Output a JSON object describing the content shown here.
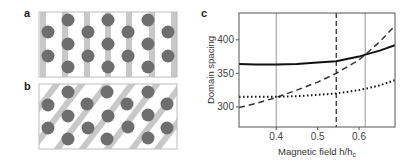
{
  "figure": {
    "panels": [
      {
        "label": "a",
        "description": "Lattice of dots with vertical stripes"
      },
      {
        "label": "b",
        "description": "Lattice of dots with tilted stripes"
      },
      {
        "label": "c",
        "description": "Domain spacing vs magnetic field"
      }
    ]
  },
  "colors": {
    "dot": "#6e6e6e",
    "stripe": "#c8c8c8",
    "frame": "#bdbdbd",
    "axis": "#555555",
    "curve": "#111111",
    "gridline": "#9a9a9a"
  },
  "panel_a": {
    "label": "a",
    "stripes_x": [
      43,
      65,
      87,
      108,
      129,
      152,
      174
    ],
    "dots": [
      [
        48,
        32
      ],
      [
        48,
        56
      ],
      [
        68,
        20
      ],
      [
        68,
        44
      ],
      [
        68,
        67
      ],
      [
        88,
        32
      ],
      [
        88,
        56
      ],
      [
        108,
        20
      ],
      [
        108,
        44
      ],
      [
        108,
        67
      ],
      [
        128,
        32
      ],
      [
        128,
        56
      ],
      [
        148,
        20
      ],
      [
        148,
        44
      ],
      [
        148,
        67
      ],
      [
        168,
        32
      ],
      [
        168,
        56
      ]
    ]
  },
  "panel_b": {
    "label": "b",
    "dots": [
      [
        48,
        105
      ],
      [
        48,
        128
      ],
      [
        68,
        92
      ],
      [
        68,
        116
      ],
      [
        68,
        139
      ],
      [
        87,
        104
      ],
      [
        88,
        128
      ],
      [
        107,
        92
      ],
      [
        108,
        116
      ],
      [
        107,
        139
      ],
      [
        127,
        104
      ],
      [
        128,
        127
      ],
      [
        148,
        92
      ],
      [
        148,
        115
      ],
      [
        148,
        138
      ],
      [
        167,
        104
      ],
      [
        167,
        128
      ]
    ]
  },
  "chart_data": {
    "type": "line",
    "panel_label": "c",
    "title": "",
    "xlabel": "Magnetic field h/h",
    "xlabel_subscript": "c",
    "ylabel": "Domain spacing",
    "xlim": [
      0.31,
      0.687
    ],
    "ylim": [
      270,
      440
    ],
    "xticks": [
      0.4,
      0.5,
      0.6
    ],
    "xtick_labels": [
      "0.4",
      "0.5",
      "0.6"
    ],
    "yticks": [
      300,
      350,
      400
    ],
    "ytick_labels": [
      "300",
      "350",
      "400"
    ],
    "grid": false,
    "legend": null,
    "vertical_lines": [
      {
        "x": 0.4,
        "style": "solid-gray"
      },
      {
        "x": 0.545,
        "style": "dashed"
      },
      {
        "x": 0.615,
        "style": "solid-gray"
      }
    ],
    "x": [
      0.31,
      0.35,
      0.4,
      0.45,
      0.5,
      0.545,
      0.6,
      0.615,
      0.65,
      0.687
    ],
    "series": [
      {
        "name": "solid",
        "style": "solid",
        "values": [
          364,
          363,
          363,
          364,
          366,
          368,
          375,
          378,
          384,
          392
        ]
      },
      {
        "name": "dashed",
        "style": "dashed",
        "values": [
          299,
          305,
          314,
          325,
          337,
          350,
          370,
          378,
          397,
          421
        ]
      },
      {
        "name": "dotted",
        "style": "dotted",
        "values": [
          315,
          315,
          315,
          316,
          318,
          320,
          325,
          327,
          332,
          340
        ]
      }
    ]
  }
}
